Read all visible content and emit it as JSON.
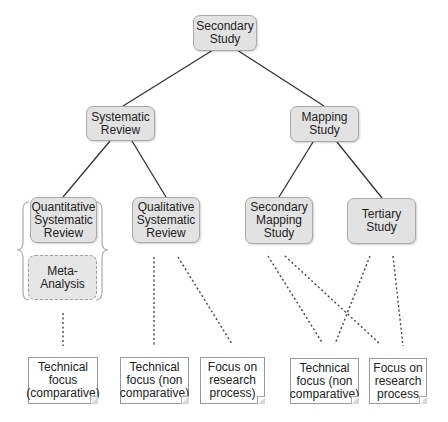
{
  "diagram": {
    "type": "tree",
    "root": {
      "id": "secondary-study",
      "label": "Secondary\nStudy"
    },
    "nodes": [
      {
        "id": "secondary-study",
        "label": "Secondary\nStudy"
      },
      {
        "id": "systematic-review",
        "label": "Systematic\nReview"
      },
      {
        "id": "mapping-study",
        "label": "Mapping\nStudy"
      },
      {
        "id": "quantitative-sr",
        "label": "Quantitative\nSystematic\nReview"
      },
      {
        "id": "qualitative-sr",
        "label": "Qualitative\nSystematic\nReview"
      },
      {
        "id": "secondary-mapping",
        "label": "Secondary\nMapping\nStudy"
      },
      {
        "id": "tertiary-study",
        "label": "Tertiary\nStudy"
      },
      {
        "id": "meta-analysis",
        "label": "Meta-\nAnalysis"
      }
    ],
    "notes": [
      {
        "id": "note-tech-comparative",
        "label": "Technical\nfocus\n(comparative)"
      },
      {
        "id": "note-tech-noncomp-1",
        "label": "Technical\nfocus (non\ncomparative)"
      },
      {
        "id": "note-research-1",
        "label": "Focus on\nresearch\nprocess)"
      },
      {
        "id": "note-tech-noncomp-2",
        "label": "Technical\nfocus (non\ncomparative)"
      },
      {
        "id": "note-research-2",
        "label": "Focus on\nresearch\nprocess"
      }
    ],
    "edges_solid": [
      [
        "secondary-study",
        "systematic-review"
      ],
      [
        "secondary-study",
        "mapping-study"
      ],
      [
        "systematic-review",
        "quantitative-sr"
      ],
      [
        "systematic-review",
        "qualitative-sr"
      ],
      [
        "mapping-study",
        "secondary-mapping"
      ],
      [
        "mapping-study",
        "tertiary-study"
      ]
    ],
    "edges_dotted": [
      [
        "meta-analysis",
        "note-tech-comparative"
      ],
      [
        "qualitative-sr",
        "note-tech-noncomp-1"
      ],
      [
        "qualitative-sr",
        "note-research-1"
      ],
      [
        "secondary-mapping",
        "note-tech-noncomp-2"
      ],
      [
        "secondary-mapping",
        "note-research-2"
      ],
      [
        "tertiary-study",
        "note-tech-noncomp-2"
      ],
      [
        "tertiary-study",
        "note-research-2"
      ]
    ],
    "grouping": {
      "type": "curly-braces",
      "encloses": [
        "quantitative-sr",
        "meta-analysis"
      ]
    }
  },
  "colors": {
    "node_fill": "#e2e2e2",
    "node_border": "#a9a9a9",
    "line": "#333333",
    "note_border": "#9a9a9a"
  }
}
